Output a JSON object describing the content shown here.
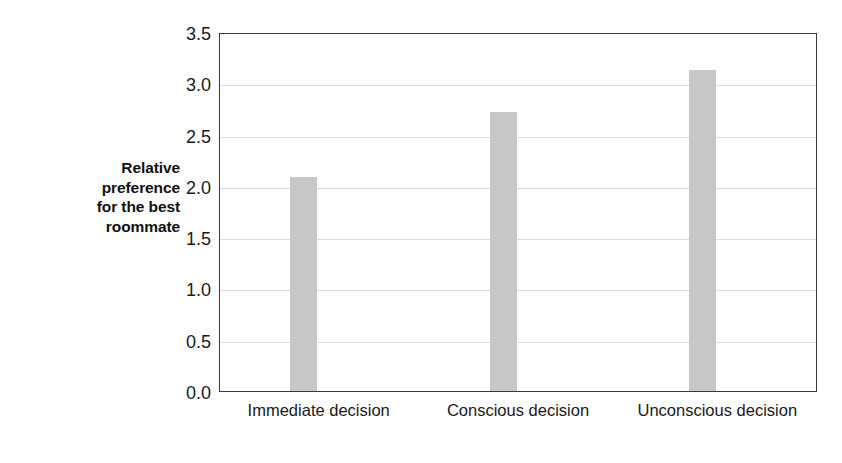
{
  "chart_data": {
    "type": "bar",
    "title": "",
    "xlabel": "",
    "ylabel": "Relative preference for the best roommate",
    "categories": [
      "Immediate decision",
      "Conscious decision",
      "Unconscious decision"
    ],
    "values": [
      2.09,
      2.72,
      3.13
    ],
    "ylim": [
      0.0,
      3.5
    ],
    "ytick_labels": [
      "0.0",
      "0.5",
      "1.0",
      "1.5",
      "2.0",
      "2.5",
      "3.0",
      "3.5"
    ],
    "ytick_values": [
      0.0,
      0.5,
      1.0,
      1.5,
      2.0,
      2.5,
      3.0,
      3.5
    ],
    "grid": true,
    "legend": false,
    "legend_position": "none",
    "bar_color": "#c7c7c7",
    "grid_color": "#dcdcdc",
    "axis_color": "#3a3a3a",
    "background_color": "#ffffff"
  },
  "ylabel_lines": {
    "line1": "Relative",
    "line2": "preference",
    "line3": "for the best",
    "line4": "roommate"
  }
}
